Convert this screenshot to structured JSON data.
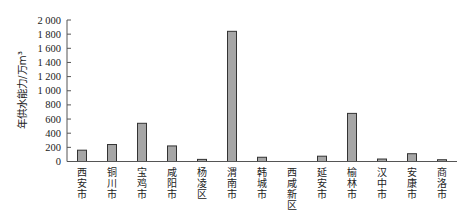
{
  "chart_data": {
    "type": "bar",
    "title": "",
    "xlabel": "",
    "ylabel": "年供水能力/万m³",
    "ylim": [
      0,
      2000
    ],
    "yticks": [
      0,
      200,
      400,
      600,
      800,
      1000,
      1200,
      1400,
      1600,
      1800,
      2000
    ],
    "ytick_labels": [
      "0",
      "200",
      "400",
      "600",
      "800",
      "1 000",
      "1 200",
      "1 400",
      "1 600",
      "1 800",
      "2 000"
    ],
    "categories": [
      "西安市",
      "铜川市",
      "宝鸡市",
      "咸阳市",
      "杨凌区",
      "渭南市",
      "韩城市",
      "西咸新区",
      "延安市",
      "榆林市",
      "汉中市",
      "安康市",
      "商洛市"
    ],
    "values": [
      160,
      240,
      540,
      220,
      30,
      1840,
      60,
      0,
      75,
      680,
      35,
      110,
      25
    ],
    "grid": false,
    "legend": null,
    "colors": {
      "bar_fill": "#a6a6a6",
      "bar_stroke": "#333333",
      "axis": "#555555"
    }
  }
}
